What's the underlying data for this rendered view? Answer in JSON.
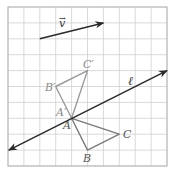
{
  "figure": {
    "grid": {
      "cols": 10,
      "rows": 10,
      "origin_px": [
        8,
        7
      ],
      "cell_px": 15.9,
      "line_color": "#cfcfcf",
      "border_color": "#b5b5b5"
    },
    "vector": {
      "label": "v",
      "from": [
        2,
        2
      ],
      "to": [
        6,
        1
      ],
      "color": "#2a2a2a"
    },
    "line_l": {
      "label": "ℓ",
      "from": [
        0.05,
        9.0
      ],
      "to": [
        10,
        4.0
      ],
      "color": "#2a2a2a"
    },
    "triangle_ABC": {
      "color": "#7a7a7a",
      "points": {
        "A": [
          4,
          7
        ],
        "B": [
          5,
          9
        ],
        "C": [
          7,
          8
        ]
      },
      "labels": {
        "A": "A",
        "B": "B",
        "C": "C"
      }
    },
    "triangle_image": {
      "color": "#9a9a9a",
      "points": {
        "A'": [
          4,
          7
        ],
        "B'": [
          3,
          5
        ],
        "C'": [
          5,
          4
        ]
      },
      "labels": {
        "A'": "A′",
        "B'": "B′",
        "C'": "C′"
      }
    }
  }
}
